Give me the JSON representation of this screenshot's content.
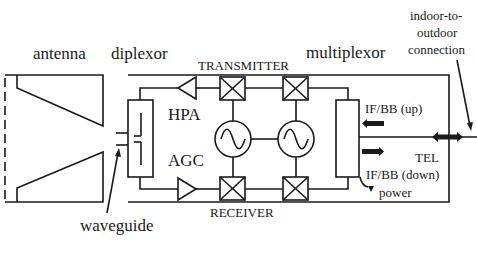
{
  "diagram": {
    "labels": {
      "antenna": "antenna",
      "diplexor": "diplexor",
      "transmitter": "TRANSMITTER",
      "multiplexor": "multiplexor",
      "indoor_outdoor": [
        "indoor-to-",
        "outdoor",
        "connection"
      ],
      "hpa": "HPA",
      "agc": "AGC",
      "receiver": "RECEIVER",
      "waveguide": "waveguide",
      "if_bb_up": "IF/BB (up)",
      "if_bb_down": "IF/BB (down)",
      "tel": "TEL",
      "power": "power"
    },
    "components": [
      {
        "id": "antenna",
        "type": "horn-antenna"
      },
      {
        "id": "diplexor",
        "type": "filter-box"
      },
      {
        "id": "hpa",
        "type": "amplifier",
        "direction": "left"
      },
      {
        "id": "agc",
        "type": "amplifier",
        "direction": "right"
      },
      {
        "id": "tx-mixer-1",
        "type": "mixer"
      },
      {
        "id": "tx-mixer-2",
        "type": "mixer"
      },
      {
        "id": "rx-mixer-1",
        "type": "mixer"
      },
      {
        "id": "rx-mixer-2",
        "type": "mixer"
      },
      {
        "id": "lo-1",
        "type": "oscillator"
      },
      {
        "id": "lo-2",
        "type": "oscillator"
      },
      {
        "id": "multiplexor",
        "type": "box"
      }
    ],
    "colors": {
      "stroke": "#1a1a1a",
      "background": "#ffffff"
    }
  }
}
